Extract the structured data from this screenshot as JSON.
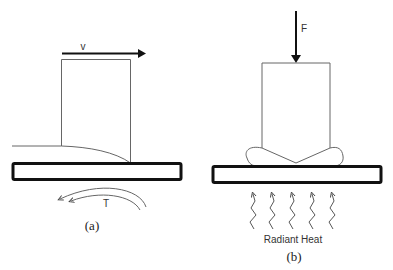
{
  "panels": [
    {
      "id": "a",
      "caption": "(a)",
      "velocity_label": "v",
      "torque_label": "T",
      "description": "Sliding tool moving with velocity v over a plate; rotating arrows labeled T beneath plate"
    },
    {
      "id": "b",
      "caption": "(b)",
      "force_label": "F",
      "heat_label": "Radiant Heat",
      "heat_arrow_count": 5,
      "description": "Tool pressed with force F onto a plate, flash bulges at tool base, radiant heat applied from below"
    }
  ],
  "colors": {
    "line": "#555555",
    "plate_outline": "#111111",
    "arrow": "#111111",
    "background": "#ffffff"
  }
}
